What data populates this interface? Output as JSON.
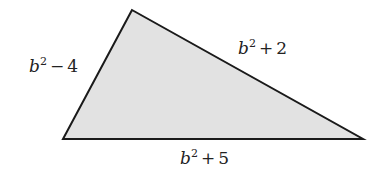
{
  "figure": {
    "type": "triangle",
    "fill_color": "#e2e2e2",
    "stroke_color": "#1a1a1a",
    "vertices": {
      "top": [
        132,
        10
      ],
      "bottom_left": [
        63,
        139
      ],
      "bottom_right": [
        363,
        139
      ]
    },
    "sides": [
      {
        "id": "left",
        "variable": "b",
        "exponent": "2",
        "operator": "−",
        "constant": "4",
        "text": "b² − 4"
      },
      {
        "id": "right",
        "variable": "b",
        "exponent": "2",
        "operator": "+",
        "constant": "2",
        "text": "b² + 2"
      },
      {
        "id": "bottom",
        "variable": "b",
        "exponent": "2",
        "operator": "+",
        "constant": "5",
        "text": "b² + 5"
      }
    ]
  }
}
